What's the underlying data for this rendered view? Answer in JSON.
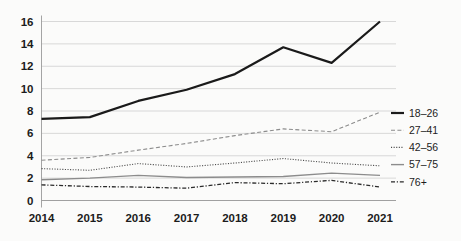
{
  "chart_data": {
    "type": "line",
    "title": "",
    "subtitle": "",
    "xlabel": "",
    "ylabel": "",
    "categories": [
      "2014",
      "2015",
      "2016",
      "2017",
      "2018",
      "2019",
      "2020",
      "2021"
    ],
    "x": [
      2014,
      2015,
      2016,
      2017,
      2018,
      2019,
      2020,
      2021
    ],
    "ylim": [
      0,
      16
    ],
    "ytick_labels": [
      "0",
      "2",
      "4",
      "6",
      "8",
      "10",
      "12",
      "14",
      "16"
    ],
    "ytick_values": [
      0,
      2,
      4,
      6,
      8,
      10,
      12,
      14,
      16
    ],
    "grid": true,
    "legend_position": "right",
    "series": [
      {
        "name": "18–26",
        "values": [
          7.3,
          7.45,
          8.9,
          9.9,
          11.3,
          13.7,
          12.3,
          16.0
        ],
        "color": "#1a1a1a",
        "style": "solid",
        "width": 2.2
      },
      {
        "name": "27–41",
        "values": [
          3.6,
          3.85,
          4.5,
          5.1,
          5.8,
          6.4,
          6.15,
          7.9
        ],
        "color": "#8c8c8c",
        "style": "dashed",
        "width": 1.1
      },
      {
        "name": "42–56",
        "values": [
          2.85,
          2.7,
          3.3,
          3.0,
          3.35,
          3.75,
          3.35,
          3.1
        ],
        "color": "#4d4d4d",
        "style": "dotted",
        "width": 1.1
      },
      {
        "name": "57–75",
        "values": [
          1.85,
          2.0,
          2.25,
          2.05,
          2.1,
          2.15,
          2.45,
          2.25
        ],
        "color": "#8c8c8c",
        "style": "solid",
        "width": 1.4
      },
      {
        "name": "76+",
        "values": [
          1.4,
          1.25,
          1.2,
          1.1,
          1.6,
          1.5,
          1.8,
          1.2
        ],
        "color": "#2b2b2b",
        "style": "dashdot",
        "width": 1.3
      }
    ]
  },
  "legend": {
    "entries": [
      {
        "label": "18–26"
      },
      {
        "label": "27–41"
      },
      {
        "label": "42–56"
      },
      {
        "label": "57–75"
      },
      {
        "label": "76+"
      }
    ]
  },
  "axes": {
    "y_ticks": [
      "16",
      "14",
      "12",
      "10",
      "8",
      "6",
      "4",
      "2",
      "0"
    ],
    "x_ticks": [
      "2014",
      "2015",
      "2016",
      "2017",
      "2018",
      "2019",
      "2020",
      "2021"
    ]
  },
  "colors": {
    "background": "#fbfbfa",
    "grid": "#c9c9c9",
    "axis": "#9a9a9a",
    "text": "#1c1c1c"
  }
}
